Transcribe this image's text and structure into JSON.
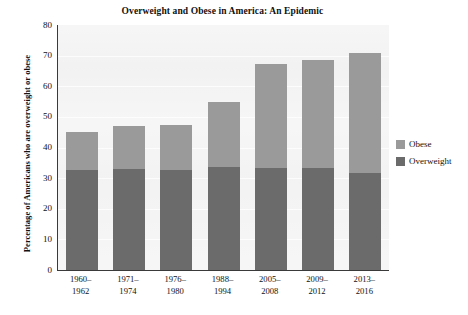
{
  "chart_data": {
    "type": "bar",
    "subtype": "stacked",
    "title": "Overweight and Obese in America: An Epidemic",
    "subtitle": "",
    "xlabel": "",
    "ylabel": "Percentage of Americans who are overweight or obese",
    "ylim": [
      0,
      80
    ],
    "yticks": [
      0,
      10,
      20,
      30,
      40,
      50,
      60,
      70,
      80
    ],
    "ytick_labels": [
      "0",
      "10",
      "20",
      "30",
      "40",
      "50",
      "60",
      "70",
      "80"
    ],
    "grid": true,
    "grid_axis": "y",
    "legend_position": "right",
    "categories": [
      "1960–1962",
      "1971–1974",
      "1976–1980",
      "1988–1994",
      "2005–2008",
      "2009–2012",
      "2013–2016"
    ],
    "category_lines": [
      [
        "1960–",
        "1962"
      ],
      [
        "1971–",
        "1974"
      ],
      [
        "1976–",
        "1980"
      ],
      [
        "1988–",
        "1994"
      ],
      [
        "2005–",
        "2008"
      ],
      [
        "2009–",
        "2012"
      ],
      [
        "2013–",
        "2016"
      ]
    ],
    "series": [
      {
        "name": "Overweight",
        "color": "#6b6b6b",
        "values": [
          32.5,
          32.9,
          32.8,
          33.8,
          33.3,
          33.2,
          31.8
        ]
      },
      {
        "name": "Obese",
        "color": "#9a9a9a",
        "values": [
          12.5,
          14.1,
          14.7,
          21.2,
          34.1,
          35.3,
          39.2
        ]
      }
    ],
    "totals": [
      45,
      47,
      47.5,
      55,
      67.4,
      68.5,
      71
    ],
    "stack_order_bottom_to_top": [
      "Overweight",
      "Obese"
    ]
  },
  "legend": {
    "items": [
      {
        "label": "Obese",
        "color": "#9a9a9a",
        "swatch": "legend-swatch-obese"
      },
      {
        "label": "Overweight",
        "color": "#6b6b6b",
        "swatch": "legend-swatch-overweight"
      }
    ]
  },
  "style": {
    "plot_background": "#ececec",
    "axis_color": "#3a3a3a",
    "text_color": "#111111",
    "gridline_color": "#fbfbfb",
    "page_background": "#ffffff"
  }
}
